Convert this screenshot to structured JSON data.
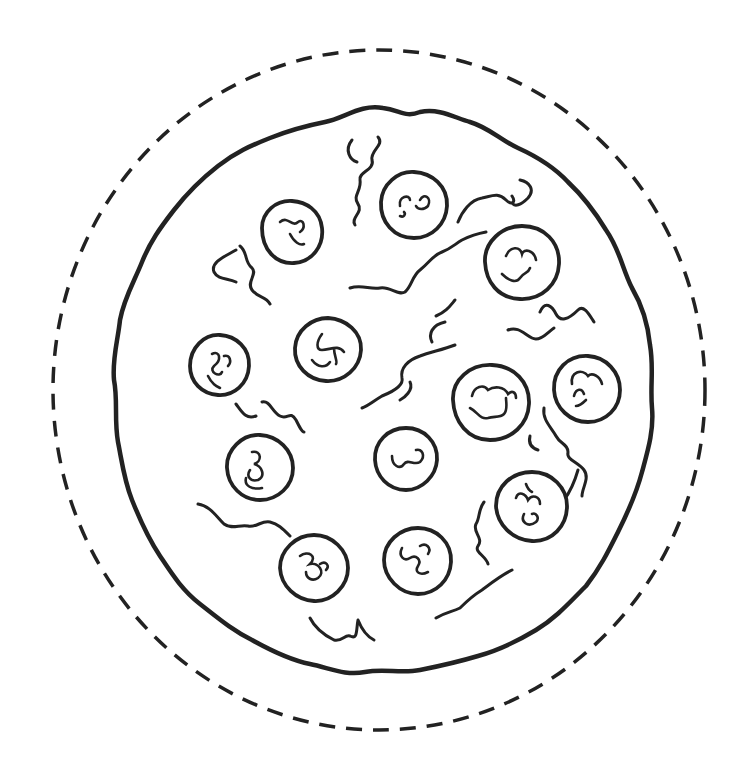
{
  "colors": {
    "background": "#ffffff",
    "line": "#222222"
  },
  "cut_line": {
    "cx": 379,
    "cy": 390,
    "rx": 326,
    "ry": 340,
    "style": "dashed"
  },
  "pizza": {
    "crust": {
      "cx": 383,
      "cy": 390,
      "rx": 269,
      "ry": 282
    },
    "pepperoni": [
      {
        "id": 1,
        "cx": 292,
        "cy": 232,
        "r": 31
      },
      {
        "id": 2,
        "cx": 414,
        "cy": 205,
        "r": 34
      },
      {
        "id": 3,
        "cx": 522,
        "cy": 262,
        "r": 37
      },
      {
        "id": 4,
        "cx": 220,
        "cy": 365,
        "r": 30
      },
      {
        "id": 5,
        "cx": 328,
        "cy": 350,
        "r": 33
      },
      {
        "id": 6,
        "cx": 491,
        "cy": 403,
        "r": 38
      },
      {
        "id": 7,
        "cx": 587,
        "cy": 388,
        "r": 33
      },
      {
        "id": 8,
        "cx": 260,
        "cy": 467,
        "r": 33
      },
      {
        "id": 9,
        "cx": 406,
        "cy": 458,
        "r": 31
      },
      {
        "id": 10,
        "cx": 532,
        "cy": 506,
        "r": 35
      },
      {
        "id": 11,
        "cx": 314,
        "cy": 568,
        "r": 34
      },
      {
        "id": 12,
        "cx": 418,
        "cy": 560,
        "r": 34
      }
    ],
    "cheese_strands_count": 14
  }
}
